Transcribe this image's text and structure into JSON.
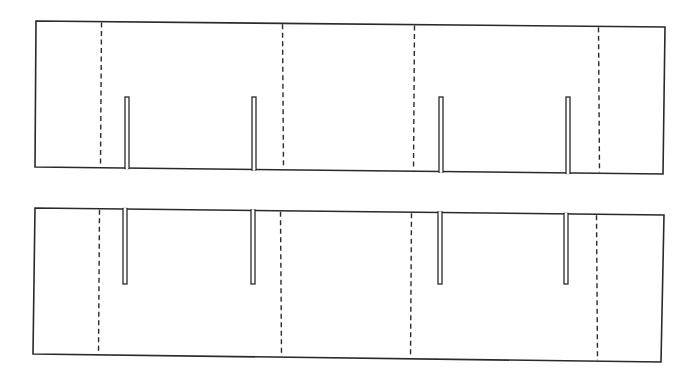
{
  "diagram": {
    "colors": {
      "line": "#2a2a2a",
      "background": "#ffffff"
    },
    "panels": [
      {
        "id": "top-panel",
        "corners": {
          "tl": [
            36,
            21
          ],
          "tr": [
            665,
            27
          ],
          "br": [
            663,
            174
          ],
          "bl": [
            35,
            167
          ]
        },
        "fold_lines_x": [
          101,
          283,
          414,
          599
        ],
        "slits": {
          "from_edge": "bottom",
          "tip_y": 97,
          "width": 4,
          "positions": [
            {
              "x": 127,
              "edge_y": 168
            },
            {
              "x": 254,
              "edge_y": 170
            },
            {
              "x": 441,
              "edge_y": 171
            },
            {
              "x": 568,
              "edge_y": 173
            }
          ]
        }
      },
      {
        "id": "bottom-panel",
        "corners": {
          "tl": [
            35,
            208
          ],
          "tr": [
            664,
            215
          ],
          "br": [
            661,
            362
          ],
          "bl": [
            33,
            354
          ]
        },
        "fold_lines_x": [
          99,
          281,
          411,
          597
        ],
        "slits": {
          "from_edge": "top",
          "tip_y": 284,
          "width": 4,
          "positions": [
            {
              "x": 125,
              "edge_y": 209
            },
            {
              "x": 253,
              "edge_y": 211
            },
            {
              "x": 440,
              "edge_y": 213
            },
            {
              "x": 566,
              "edge_y": 214
            }
          ]
        }
      }
    ]
  }
}
